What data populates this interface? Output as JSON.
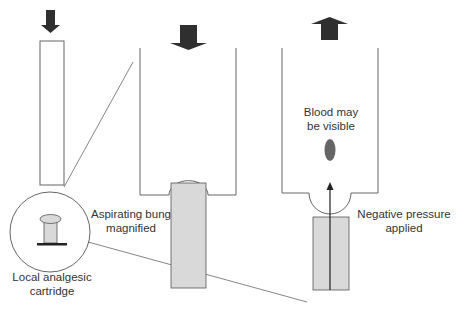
{
  "colors": {
    "line": "#555555",
    "arrow": "#2f2f2f",
    "bung_fill": "#d9d9d9",
    "blood": "#666666",
    "text": "#333333",
    "background": "#ffffff"
  },
  "labels": {
    "left_caption_line1": "Local analgesic",
    "left_caption_line2": "cartridge",
    "middle_caption_line1": "Aspirating bung",
    "middle_caption_line2": "magnified",
    "right_top_line1": "Blood may",
    "right_top_line2": "be visible",
    "right_caption_line1": "Negative pressure",
    "right_caption_line2": "applied"
  },
  "icons": {
    "left_arrow": "down-arrow",
    "middle_arrow": "down-arrow",
    "right_arrow": "up-arrow"
  }
}
